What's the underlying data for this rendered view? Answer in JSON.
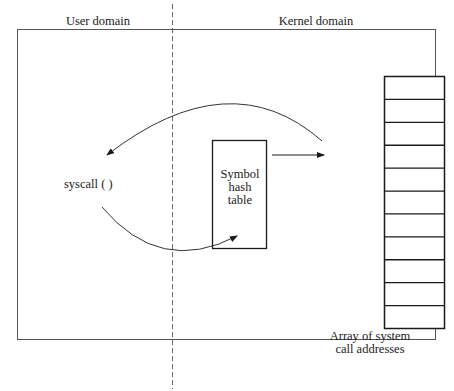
{
  "diagram": {
    "regions": {
      "user": "User domain",
      "kernel": "Kernel domain"
    },
    "nodes": {
      "syscall": "syscall (  )",
      "symbol_table": [
        "Symbol",
        "hash",
        "table"
      ],
      "array_caption": [
        "Array of system",
        "call addresses"
      ]
    },
    "array": {
      "rows": 11
    },
    "colors": {
      "stroke": "#1a1a1a",
      "frame": "#555555",
      "background": "#ffffff"
    }
  }
}
